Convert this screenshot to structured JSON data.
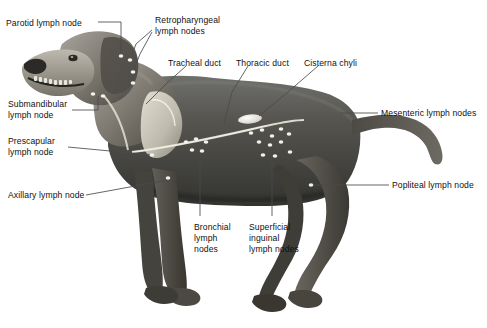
{
  "figure": {
    "title": "",
    "background_color": "#ffffff",
    "label_color": "#111111",
    "leader_color": "#4a4a4a",
    "node_color": "#f2f2ee"
  },
  "labels": [
    {
      "id": "parotid",
      "text": "Parotid lymph node",
      "lines": [
        "Parotid lymph node"
      ],
      "x": 6,
      "y": 18,
      "align": "left"
    },
    {
      "id": "retropharyngeal",
      "text": "Retropharyngeal lymph nodes",
      "lines": [
        "Retropharyngeal",
        "lymph nodes"
      ],
      "x": 155,
      "y": 16,
      "align": "left"
    },
    {
      "id": "tracheal",
      "text": "Tracheal duct",
      "lines": [
        "Tracheal duct"
      ],
      "x": 168,
      "y": 58,
      "align": "left"
    },
    {
      "id": "thoracic",
      "text": "Thoracic duct",
      "lines": [
        "Thoracic duct"
      ],
      "x": 236,
      "y": 58,
      "align": "left"
    },
    {
      "id": "cisterna",
      "text": "Cisterna chyli",
      "lines": [
        "Cisterna chyli"
      ],
      "x": 304,
      "y": 58,
      "align": "left"
    },
    {
      "id": "mesenteric",
      "text": "Mesenteric lymph nodes",
      "lines": [
        "Mesenteric lymph nodes"
      ],
      "x": 381,
      "y": 110,
      "align": "left"
    },
    {
      "id": "popliteal",
      "text": "Popliteal lymph node",
      "lines": [
        "Popliteal lymph node"
      ],
      "x": 392,
      "y": 182,
      "align": "left"
    },
    {
      "id": "submandibular",
      "text": "Submandibular lymph node",
      "lines": [
        "Submandibular",
        "lymph node"
      ],
      "x": 8,
      "y": 99,
      "align": "left"
    },
    {
      "id": "prescapular",
      "text": "Prescapular lymph node",
      "lines": [
        "Prescapular",
        "lymph node"
      ],
      "x": 8,
      "y": 136,
      "align": "left"
    },
    {
      "id": "axillary",
      "text": "Axillary lymph node",
      "lines": [
        "Axillary lymph node"
      ],
      "x": 8,
      "y": 190,
      "align": "left"
    },
    {
      "id": "bronchial",
      "text": "Bronchial lymph nodes",
      "lines": [
        "Bronchial",
        "lymph",
        "nodes"
      ],
      "x": 194,
      "y": 222,
      "align": "left"
    },
    {
      "id": "inguinal",
      "text": "Superficial inguinal lymph nodes",
      "lines": [
        "Superficial",
        "inguinal",
        "lymph nodes"
      ],
      "x": 249,
      "y": 222,
      "align": "left"
    }
  ],
  "structures": [
    {
      "id": "thoracic-duct",
      "name": "thoracic duct"
    },
    {
      "id": "tracheal-duct",
      "name": "tracheal duct"
    },
    {
      "id": "cisterna-chyli",
      "name": "cisterna chyli"
    },
    {
      "id": "scapula",
      "name": "scapula"
    }
  ],
  "node_markers": [
    {
      "group": "parotid",
      "x": 121,
      "y": 56
    },
    {
      "group": "retropharyngeal",
      "x": 130,
      "y": 60
    },
    {
      "group": "retropharyngeal",
      "x": 133,
      "y": 72
    },
    {
      "group": "retropharyngeal",
      "x": 133,
      "y": 83
    },
    {
      "group": "submandibular",
      "x": 93,
      "y": 94
    },
    {
      "group": "submandibular",
      "x": 103,
      "y": 96
    },
    {
      "group": "prescapular",
      "x": 152,
      "y": 155
    },
    {
      "group": "axillary",
      "x": 168,
      "y": 178
    },
    {
      "group": "bronchial",
      "x": 186,
      "y": 142
    },
    {
      "group": "bronchial",
      "x": 196,
      "y": 139
    },
    {
      "group": "bronchial",
      "x": 206,
      "y": 142
    },
    {
      "group": "bronchial",
      "x": 192,
      "y": 150
    },
    {
      "group": "bronchial",
      "x": 202,
      "y": 151
    },
    {
      "group": "mesenteric",
      "x": 251,
      "y": 133
    },
    {
      "group": "mesenteric",
      "x": 262,
      "y": 130
    },
    {
      "group": "mesenteric",
      "x": 272,
      "y": 136
    },
    {
      "group": "mesenteric",
      "x": 281,
      "y": 129
    },
    {
      "group": "mesenteric",
      "x": 289,
      "y": 134
    },
    {
      "group": "mesenteric",
      "x": 259,
      "y": 142
    },
    {
      "group": "mesenteric",
      "x": 270,
      "y": 145
    },
    {
      "group": "mesenteric",
      "x": 281,
      "y": 142
    },
    {
      "group": "inguinal",
      "x": 263,
      "y": 155
    },
    {
      "group": "inguinal",
      "x": 275,
      "y": 156
    },
    {
      "group": "inguinal",
      "x": 290,
      "y": 152
    },
    {
      "group": "popliteal",
      "x": 311,
      "y": 185
    }
  ]
}
